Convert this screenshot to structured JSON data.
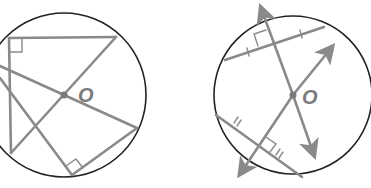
{
  "figure_left": {
    "center_label": "O",
    "colors": {
      "circle": "#222222",
      "lines": "#8a8a8a"
    }
  },
  "figure_right": {
    "center_label": "O",
    "colors": {
      "circle": "#222222",
      "lines": "#8a8a8a"
    }
  }
}
